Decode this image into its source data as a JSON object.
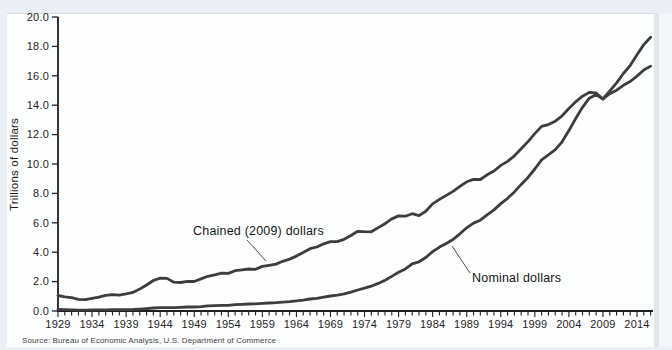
{
  "source": "Source: Bureau of Economic Analysis, U.S. Department of Commerce",
  "chart_data": {
    "type": "line",
    "title": "",
    "ylabel": "Trillions of dollars",
    "xlabel": "",
    "ylim": [
      0,
      20
    ],
    "grid": false,
    "legend": "inline-annotations",
    "axis_color": "#1f1f1f",
    "line_color": "#3b3d40",
    "y_tick_labels": [
      "0.0",
      "2.0",
      "4.0",
      "6.0",
      "8.0",
      "10.0",
      "12.0",
      "14.0",
      "16.0",
      "18.0",
      "20.0"
    ],
    "x_start": 1929,
    "x_end": 2016,
    "x_tick_labels": [
      "1929",
      "1934",
      "1939",
      "1944",
      "1949",
      "1954",
      "1959",
      "1964",
      "1969",
      "1974",
      "1979",
      "1984",
      "1989",
      "1994",
      "1999",
      "2004",
      "2009",
      "2014"
    ],
    "series": [
      {
        "name": "Chained (2009) dollars",
        "values": [
          1.057,
          0.967,
          0.905,
          0.788,
          0.778,
          0.862,
          0.939,
          1.061,
          1.115,
          1.077,
          1.163,
          1.266,
          1.49,
          1.772,
          2.074,
          2.239,
          2.218,
          1.961,
          1.939,
          2.02,
          2.009,
          2.184,
          2.36,
          2.456,
          2.571,
          2.556,
          2.74,
          2.797,
          2.856,
          2.835,
          3.031,
          3.108,
          3.188,
          3.383,
          3.53,
          3.734,
          3.977,
          4.239,
          4.355,
          4.569,
          4.713,
          4.722,
          4.878,
          5.134,
          5.424,
          5.396,
          5.385,
          5.675,
          5.937,
          6.267,
          6.466,
          6.45,
          6.618,
          6.491,
          6.792,
          7.285,
          7.594,
          7.861,
          8.133,
          8.475,
          8.786,
          8.955,
          8.948,
          9.267,
          9.521,
          9.905,
          10.175,
          10.561,
          11.035,
          11.526,
          12.066,
          12.56,
          12.682,
          12.909,
          13.271,
          13.774,
          14.234,
          14.614,
          14.874,
          14.83,
          14.419,
          14.784,
          15.021,
          15.355,
          15.612,
          15.982,
          16.397,
          16.662
        ]
      },
      {
        "name": "Nominal dollars",
        "values": [
          0.105,
          0.092,
          0.077,
          0.06,
          0.057,
          0.067,
          0.074,
          0.085,
          0.093,
          0.087,
          0.093,
          0.103,
          0.129,
          0.166,
          0.203,
          0.224,
          0.228,
          0.228,
          0.25,
          0.275,
          0.273,
          0.3,
          0.347,
          0.368,
          0.39,
          0.391,
          0.426,
          0.45,
          0.475,
          0.482,
          0.522,
          0.543,
          0.563,
          0.605,
          0.639,
          0.686,
          0.744,
          0.815,
          0.862,
          0.943,
          1.02,
          1.076,
          1.168,
          1.282,
          1.429,
          1.549,
          1.689,
          1.878,
          2.086,
          2.357,
          2.632,
          2.863,
          3.211,
          3.345,
          3.638,
          4.041,
          4.347,
          4.59,
          4.87,
          5.253,
          5.658,
          5.98,
          6.174,
          6.539,
          6.879,
          7.309,
          7.664,
          8.1,
          8.609,
          9.089,
          9.661,
          10.285,
          10.622,
          10.978,
          11.511,
          12.275,
          13.094,
          13.856,
          14.478,
          14.719,
          14.419,
          14.964,
          15.518,
          16.155,
          16.692,
          17.428,
          18.121,
          18.624
        ]
      }
    ],
    "annotations": [
      {
        "text": "Chained (2009) dollars",
        "leader": [
          247,
          240,
          266,
          261
        ]
      },
      {
        "text": "Nominal dollars",
        "leader": [
          452,
          246,
          470,
          273
        ]
      }
    ]
  }
}
